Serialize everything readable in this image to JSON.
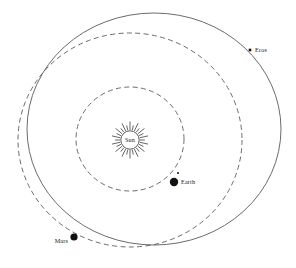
{
  "figure": {
    "background_color": "#ffffff",
    "width": 296,
    "height": 268
  },
  "chart_data": {
    "type": "scatter",
    "xlabel": "",
    "ylabel": "",
    "grid": false,
    "legend": "none",
    "projection": "orbital-plane-top-down",
    "center_body": {
      "name": "Sun",
      "label": "Sun",
      "cx": 130,
      "cy": 140,
      "core_radius": 9.2,
      "ray_count": 28,
      "ray_inner_radius": 10.0,
      "ray_outer_radius": 18.5,
      "symbol": "sun-rays"
    },
    "orbits": [
      {
        "name": "earth-orbit",
        "body": "Earth",
        "style": "dashed",
        "stroke": "#5a5a5a",
        "cx": 130,
        "cy": 139,
        "rx": 54,
        "ry": 52
      },
      {
        "name": "mars-orbit",
        "body": "Mars",
        "style": "dashed",
        "stroke": "#5a5a5a",
        "cx": 130,
        "cy": 140,
        "rx": 112,
        "ry": 107
      },
      {
        "name": "eros-orbit",
        "body": "Eros",
        "style": "solid",
        "stroke": "#5a5a5a",
        "cx": 154,
        "cy": 129,
        "rx": 127,
        "ry": 116
      }
    ],
    "bodies": [
      {
        "name": "Earth",
        "label": "Earth",
        "marker": "filled-circle",
        "x": 174,
        "y": 182,
        "radius": 4.2,
        "color": "#111111",
        "label_x": 181,
        "label_y": 184,
        "label_anchor": "start",
        "satellite": {
          "name": "moon-marker",
          "x": 178,
          "y": 173,
          "radius": 1.0
        }
      },
      {
        "name": "Mars",
        "label": "Mars",
        "marker": "filled-circle",
        "x": 74,
        "y": 237,
        "radius": 3.6,
        "color": "#111111",
        "label_x": 68,
        "label_y": 243,
        "label_anchor": "end"
      },
      {
        "name": "Eros",
        "label": "Eros",
        "marker": "filled-square",
        "x": 250,
        "y": 50,
        "size": 2.6,
        "color": "#111111",
        "label_x": 255,
        "label_y": 52,
        "label_anchor": "start"
      }
    ]
  }
}
